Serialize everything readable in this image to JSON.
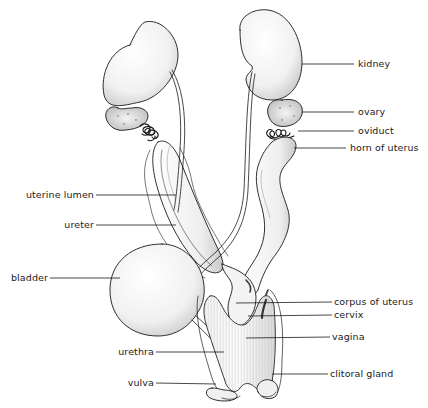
{
  "figure": {
    "type": "anatomical-diagram",
    "ink_color": "#1a1a1a",
    "background": "#ffffff"
  },
  "labels": {
    "kidney": "kidney",
    "ovary": "ovary",
    "oviduct": "oviduct",
    "horn_of_uterus": "horn of uterus",
    "uterine_lumen": "uterine lumen",
    "ureter": "ureter",
    "bladder": "bladder",
    "corpus_of_uterus": "corpus of uterus",
    "cervix": "cervix",
    "vagina": "vagina",
    "urethra": "urethra",
    "clitoral_gland": "clitoral gland",
    "vulva": "vulva"
  }
}
